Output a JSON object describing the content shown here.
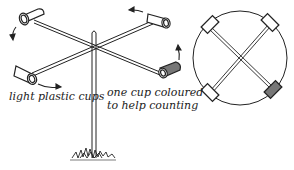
{
  "diagram": {
    "side_view": {
      "labels": {
        "cups": "light plastic cups",
        "coloured_cup_line1": "one cup coloured",
        "coloured_cup_line2": "to help counting"
      },
      "parts": [
        "cup",
        "cup",
        "cup",
        "coloured-cup",
        "cross-arms",
        "vertical-pole",
        "grass-base",
        "rotation-arrows"
      ]
    },
    "top_view": {
      "parts": [
        "rotation-circle",
        "cross-arms",
        "cup",
        "cup",
        "cup",
        "coloured-cup"
      ]
    },
    "colors": {
      "ink": "#222222",
      "coloured_cup": "#777777",
      "background": "#ffffff"
    }
  }
}
